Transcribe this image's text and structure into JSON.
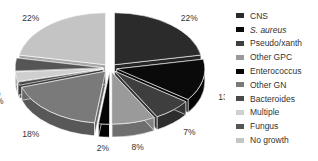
{
  "chart_data": {
    "type": "pie",
    "style": "3d-exploded",
    "title": "",
    "categories": [
      "CNS",
      "S. aureus",
      "Pseudo/xanth",
      "Other GPC",
      "Enterococcus",
      "Other GN",
      "Bacteroides",
      "Multiple",
      "Fungus",
      "No growth"
    ],
    "values": [
      22,
      13,
      7,
      8,
      2,
      18,
      1,
      3,
      4,
      22
    ],
    "unit": "%",
    "colors": [
      "#2b2b2b",
      "#0a0a0a",
      "#3e3e3e",
      "#9a9a9a",
      "#050505",
      "#7a7a7a",
      "#4a4a4a",
      "#cfcfcf",
      "#555555",
      "#c4c4c4"
    ],
    "italic_labels": [
      "S. aureus"
    ],
    "legend_position": "right",
    "data_labels": [
      "22%",
      "13%",
      "7%",
      "8%",
      "2%",
      "18%",
      "1%",
      "3%",
      "4%",
      "22%"
    ]
  },
  "legend": {
    "items": [
      {
        "label": "CNS",
        "color": "#2b2b2b"
      },
      {
        "label": "S. aureus",
        "color": "#0a0a0a"
      },
      {
        "label": "Pseudo/xanth",
        "color": "#3e3e3e"
      },
      {
        "label": "Other GPC",
        "color": "#9a9a9a"
      },
      {
        "label": "Enterococcus",
        "color": "#050505"
      },
      {
        "label": "Other GN",
        "color": "#7a7a7a"
      },
      {
        "label": "Bacteroides",
        "color": "#4a4a4a"
      },
      {
        "label": "Multiple",
        "color": "#cfcfcf"
      },
      {
        "label": "Fungus",
        "color": "#555555"
      },
      {
        "label": "No growth",
        "color": "#c4c4c4"
      }
    ]
  }
}
